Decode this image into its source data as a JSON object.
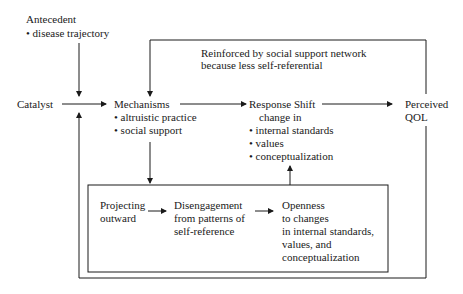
{
  "antecedent": {
    "title": "Antecedent",
    "bullet": "• disease trajectory"
  },
  "reinforced": {
    "line1": "Reinforced by social support network",
    "line2": "because less self-referential"
  },
  "catalyst": "Catalyst",
  "mechanisms": {
    "title": "Mechanisms",
    "items": [
      "• altruistic practice",
      "• social support"
    ]
  },
  "response_shift": {
    "title": "Response Shift",
    "subtitle": "change in",
    "items": [
      "• internal standards",
      "• values",
      "• conceptualization"
    ]
  },
  "perceived_qol": {
    "line1": "Perceived",
    "line2": "QOL"
  },
  "inner_box": {
    "projecting": {
      "line1": "Projecting",
      "line2": "outward"
    },
    "disengagement": {
      "line1": "Disengagement",
      "line2": "from patterns of",
      "line3": "self-reference"
    },
    "openness": {
      "line1": "Openness",
      "line2": "to changes",
      "line3": "in internal standards,",
      "line4": "values, and",
      "line5": "conceptualization"
    }
  }
}
